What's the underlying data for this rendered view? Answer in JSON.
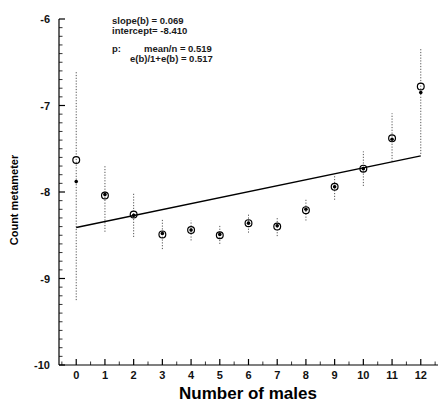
{
  "chart_data": {
    "type": "scatter",
    "title": "",
    "xlabel": "Number of males",
    "ylabel": "Count metameter",
    "xlim": [
      -0.6,
      12.6
    ],
    "ylim": [
      -10,
      -6
    ],
    "xticks": [
      0,
      1,
      2,
      3,
      4,
      5,
      6,
      7,
      8,
      9,
      10,
      11,
      12
    ],
    "xtick_labels": [
      "0",
      "1",
      "2",
      "3",
      "4",
      "5",
      "6",
      "7",
      "8",
      "9",
      "10",
      "11",
      "12"
    ],
    "yticks": [
      -6,
      -7,
      -8,
      -9,
      -10
    ],
    "ytick_labels": [
      "-6",
      "-7",
      "-8",
      "-9",
      "-10"
    ],
    "grid": false,
    "minor_ticks": true,
    "legend": "none",
    "x": [
      0,
      1,
      2,
      3,
      4,
      5,
      6,
      7,
      8,
      9,
      10,
      11,
      12
    ],
    "series": [
      {
        "name": "observed (open circle)",
        "marker": "open-circle",
        "values": [
          -7.63,
          -8.04,
          -8.26,
          -8.49,
          -8.44,
          -8.5,
          -8.36,
          -8.4,
          -8.21,
          -7.94,
          -7.73,
          -7.38,
          -6.78
        ]
      },
      {
        "name": "fitted (filled dot)",
        "marker": "filled-dot",
        "values": [
          -7.88,
          -8.03,
          -8.27,
          -8.48,
          -8.44,
          -8.49,
          -8.36,
          -8.39,
          -8.2,
          -7.94,
          -7.73,
          -7.39,
          -6.85
        ]
      }
    ],
    "error_bars": [
      {
        "x": 0,
        "lower": -9.25,
        "upper": -6.6
      },
      {
        "x": 1,
        "lower": -8.46,
        "upper": -7.7
      },
      {
        "x": 2,
        "lower": -8.52,
        "upper": -8.02
      },
      {
        "x": 3,
        "lower": -8.66,
        "upper": -8.31
      },
      {
        "x": 4,
        "lower": -8.56,
        "upper": -8.33
      },
      {
        "x": 5,
        "lower": -8.6,
        "upper": -8.39
      },
      {
        "x": 6,
        "lower": -8.47,
        "upper": -8.26
      },
      {
        "x": 7,
        "lower": -8.51,
        "upper": -8.29
      },
      {
        "x": 8,
        "lower": -8.33,
        "upper": -8.09
      },
      {
        "x": 9,
        "lower": -8.09,
        "upper": -7.8
      },
      {
        "x": 10,
        "lower": -7.93,
        "upper": -7.53
      },
      {
        "x": 11,
        "lower": -7.65,
        "upper": -7.09
      },
      {
        "x": 12,
        "lower": -7.56,
        "upper": -6.34
      }
    ],
    "fit_line": {
      "slope": 0.069,
      "intercept": -8.41,
      "x_start": 0,
      "x_end": 12,
      "y_start": -8.41,
      "y_end": -7.582
    }
  },
  "annotations": {
    "slope_line": "slope(b) = 0.069",
    "intercept_line": "intercept= -8.410",
    "p_label": "p:",
    "p_mean_line": "mean/n = 0.519",
    "p_ebe_line": "e(b)/1+e(b) = 0.517"
  },
  "axes": {
    "x_title": "Number of males",
    "y_title": "Count metameter"
  }
}
